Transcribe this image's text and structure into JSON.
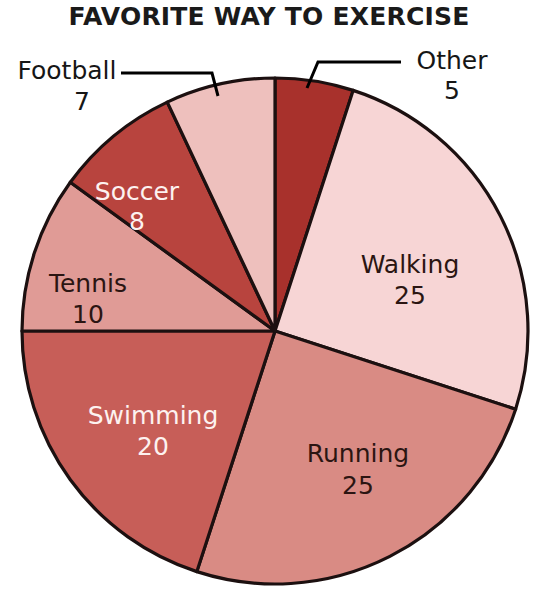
{
  "chart": {
    "title": "FAVORITE WAY TO EXERCISE"
  },
  "chart_data": {
    "type": "pie",
    "title": "FAVORITE WAY TO EXERCISE",
    "xlabel": "",
    "ylabel": "",
    "total": 100,
    "start_angle_deg": 0,
    "direction": "clockwise",
    "legend": "none",
    "labels_inside_slices": true,
    "categories": [
      "Other",
      "Walking",
      "Running",
      "Swimming",
      "Tennis",
      "Soccer",
      "Football"
    ],
    "values": [
      5,
      25,
      25,
      20,
      10,
      8,
      7
    ],
    "colors": [
      "#a8312c",
      "#f7d5d5",
      "#d98b84",
      "#c75e58",
      "#e09b96",
      "#b8443e",
      "#eec0bd"
    ],
    "slices": [
      {
        "name": "Other",
        "label": "Other",
        "value": "5",
        "value_num": 5,
        "color": "#a8312c",
        "text_color": "#161616",
        "placement": "callout",
        "label_x": 452,
        "label_y": 62,
        "value_x": 452,
        "value_y": 92
      },
      {
        "name": "Walking",
        "label": "Walking",
        "value": "25",
        "value_num": 25,
        "color": "#f7d5d5",
        "text_color": "#2b1512",
        "placement": "inside",
        "label_x": 410,
        "label_y": 266,
        "value_x": 410,
        "value_y": 297
      },
      {
        "name": "Running",
        "label": "Running",
        "value": "25",
        "value_num": 25,
        "color": "#d98b84",
        "text_color": "#2b1512",
        "placement": "inside",
        "label_x": 358,
        "label_y": 455,
        "value_x": 358,
        "value_y": 487
      },
      {
        "name": "Swimming",
        "label": "Swimming",
        "value": "20",
        "value_num": 20,
        "color": "#c75e58",
        "text_color": "#fdf2f0",
        "placement": "inside",
        "label_x": 153,
        "label_y": 417,
        "value_x": 153,
        "value_y": 448
      },
      {
        "name": "Tennis",
        "label": "Tennis",
        "value": "10",
        "value_num": 10,
        "color": "#e09b96",
        "text_color": "#2b1512",
        "placement": "inside",
        "label_x": 88,
        "label_y": 285,
        "value_x": 88,
        "value_y": 316
      },
      {
        "name": "Soccer",
        "label": "Soccer",
        "value": "8",
        "value_num": 8,
        "color": "#b8443e",
        "text_color": "#fdf2f0",
        "placement": "inside",
        "label_x": 137,
        "label_y": 193,
        "value_x": 137,
        "value_y": 223
      },
      {
        "name": "Football",
        "label": "Football",
        "value": "7",
        "value_num": 7,
        "color": "#eec0bd",
        "text_color": "#161616",
        "placement": "callout",
        "label_x": 67,
        "label_y": 72,
        "value_x": 82,
        "value_y": 103
      }
    ]
  }
}
